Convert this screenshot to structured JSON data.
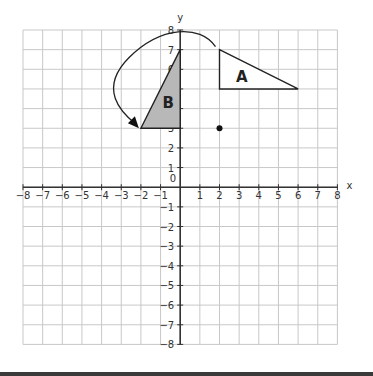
{
  "axes": {
    "x_label": "x",
    "y_label": "y",
    "origin_label": "0",
    "xmin": -8,
    "xmax": 8,
    "ymin": -8,
    "ymax": 8,
    "x_ticks": [
      "-8",
      "-7",
      "-6",
      "-5",
      "-4",
      "-3",
      "-2",
      "-1",
      "1",
      "2",
      "3",
      "4",
      "5",
      "6",
      "7",
      "8"
    ],
    "y_ticks": [
      "8",
      "7",
      "6",
      "5",
      "4",
      "3",
      "2",
      "1",
      "-1",
      "-2",
      "-3",
      "-4",
      "-5",
      "-6",
      "-7",
      "-8"
    ]
  },
  "shapes": {
    "triangle_a": {
      "label": "A",
      "vertices": [
        [
          2,
          7
        ],
        [
          2,
          5
        ],
        [
          6,
          5
        ]
      ],
      "fill": "#ffffff"
    },
    "triangle_b": {
      "label": "B",
      "vertices": [
        [
          0,
          7
        ],
        [
          0,
          3
        ],
        [
          -2,
          3
        ]
      ],
      "fill": "#b8b8b8"
    },
    "center_point": {
      "x": 2,
      "y": 3
    },
    "rotation_arrow": {
      "from": [
        2,
        7
      ],
      "to": [
        -2,
        3
      ],
      "direction": "counterclockwise"
    }
  },
  "colors": {
    "grid": "#c8c8c8",
    "axis": "#333333",
    "shape_stroke": "#222222"
  }
}
